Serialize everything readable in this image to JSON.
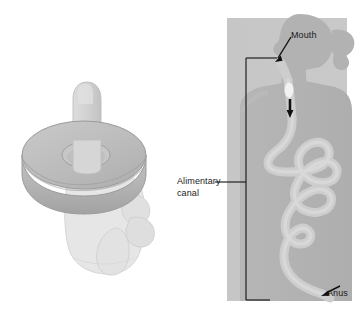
{
  "figure": {
    "caption_partial": "",
    "background_color": "#ffffff"
  },
  "labels": {
    "mouth": "Mouth",
    "alimentary_canal": "Alimentary canal",
    "alimentary_canal_line1": "Alimentary",
    "alimentary_canal_line2": "canal",
    "anus": "Anus"
  },
  "colors": {
    "panel_background": "#c9c9c9",
    "body_silhouette": "#b3b3b3",
    "canal_lumen": "#cfcfcf",
    "donut_body": "#b0b0b0",
    "donut_top": "#bdbdbd",
    "finger": "#d2d2d2",
    "hand": "#e4e4e4",
    "outline": "#9a9a9a",
    "leader_line": "#111111",
    "text": "#1a1a1a"
  },
  "left_illustration": {
    "name": "hand-donut-analogy",
    "description": "A closed fist with the index finger pushed up through the hole of a donut",
    "parts": [
      "donut",
      "finger",
      "fist"
    ]
  },
  "right_illustration": {
    "name": "human-figure-alimentary-canal",
    "description": "Grey silhouette of a person in profile on a light grey panel, showing the continuous alimentary canal from mouth through esophagus and coiled intestines to the anus",
    "parts": [
      "head",
      "ponytail",
      "neck",
      "torso",
      "esophagus",
      "food-bolus",
      "intestine-coils",
      "rectum",
      "anus",
      "measurement-bracket"
    ]
  },
  "annotations": [
    {
      "id": "mouth",
      "label": "Mouth",
      "target": "mouth opening",
      "arrow": "down-left"
    },
    {
      "id": "alimentary-canal",
      "label": "Alimentary canal",
      "target": "bracket spanning mouth to anus",
      "arrow": "leader-line"
    },
    {
      "id": "anus",
      "label": "Anus",
      "target": "anus opening",
      "arrow": "down-left"
    }
  ]
}
